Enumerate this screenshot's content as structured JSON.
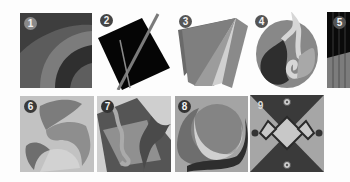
{
  "gallery": {
    "tiles": [
      {
        "number": "1",
        "theme": "concentric arcs"
      },
      {
        "number": "2",
        "theme": "rotated black square with crossing lines"
      },
      {
        "number": "3",
        "theme": "fanned ribbons"
      },
      {
        "number": "4",
        "theme": "egg with swirling flame"
      },
      {
        "number": "5",
        "theme": "vertical stripes split diagonally"
      },
      {
        "number": "6",
        "theme": "curled leaf shapes"
      },
      {
        "number": "7",
        "theme": "tilted squares with seahorse and leaf"
      },
      {
        "number": "8",
        "theme": "circle with crescent swoosh"
      },
      {
        "number": "9",
        "theme": "hourglass with diamonds and dots"
      }
    ]
  },
  "colors": {
    "background": "#fdfdfd",
    "dark": "#2e2e2e",
    "mid_dark": "#5a5a5a",
    "mid": "#7d7d7d",
    "light": "#a8a8a8",
    "lighter": "#c6c6c6",
    "black": "#050505"
  }
}
